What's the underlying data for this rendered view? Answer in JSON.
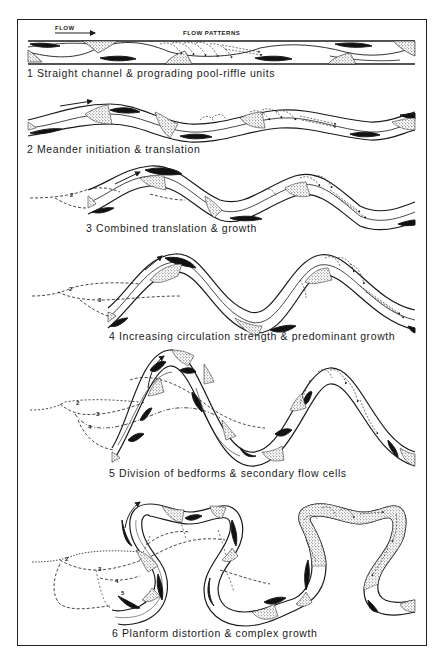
{
  "figure": {
    "labels": {
      "flow": "FLOW",
      "flow_patterns": "FLOW PATTERNS"
    },
    "panels": [
      {
        "number": "1",
        "caption": "1 Straight channel & prograding pool-riffle units"
      },
      {
        "number": "2",
        "caption": "2 Meander initiation & translation"
      },
      {
        "number": "3",
        "caption": "3 Combined translation & growth"
      },
      {
        "number": "4",
        "caption": "4 Increasing circulation strength & predominant growth"
      },
      {
        "number": "5",
        "caption": "5 Division of bedforms & secondary flow cells"
      },
      {
        "number": "6",
        "caption": "6 Planform distortion & complex growth"
      }
    ],
    "previous_stage_markers": {
      "panel3": [
        "2"
      ],
      "panel4": [
        "2",
        "3"
      ],
      "panel5": [
        "2",
        "3",
        "4"
      ],
      "panel6": [
        "2",
        "3",
        "4",
        "5"
      ]
    },
    "legend_symbols": {
      "pool": "black-filled elongate shape",
      "riffle_bar": "stippled shape",
      "previous_channel_positions": "dashed lines"
    },
    "colors": {
      "ink": "#1a1a1a",
      "background": "#ffffff"
    }
  }
}
